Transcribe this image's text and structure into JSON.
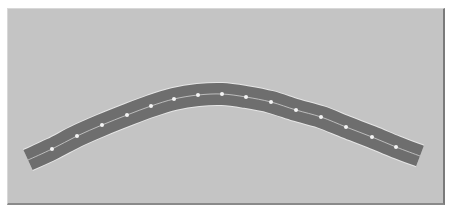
{
  "diagram": {
    "title": "",
    "background_color": "#c4c4c4",
    "band": {
      "color": "#6e6e6e",
      "edge_color": "#e6e6e6",
      "width": 22,
      "centerline_color": "#d0d0d0",
      "path": [
        [
          28,
          160
        ],
        [
          52,
          149
        ],
        [
          77,
          136
        ],
        [
          102,
          125
        ],
        [
          127,
          115
        ],
        [
          151,
          106
        ],
        [
          174,
          99
        ],
        [
          198,
          95
        ],
        [
          222,
          94
        ],
        [
          246,
          97
        ],
        [
          271,
          102
        ],
        [
          296,
          110
        ],
        [
          321,
          117
        ],
        [
          346,
          127
        ],
        [
          372,
          137
        ],
        [
          396,
          147
        ],
        [
          420,
          156
        ]
      ]
    },
    "nodes": {
      "color": "#f4f4f4",
      "radius": 2,
      "points": [
        [
          52,
          149
        ],
        [
          77,
          136
        ],
        [
          102,
          125
        ],
        [
          127,
          115
        ],
        [
          151,
          106
        ],
        [
          174,
          99
        ],
        [
          198,
          95
        ],
        [
          222,
          94
        ],
        [
          246,
          97
        ],
        [
          271,
          102
        ],
        [
          296,
          110
        ],
        [
          321,
          117
        ],
        [
          346,
          127
        ],
        [
          372,
          137
        ],
        [
          396,
          147
        ]
      ]
    }
  }
}
